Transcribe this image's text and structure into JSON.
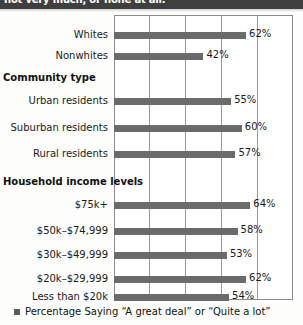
{
  "banner": {
    "text": "not very much, or none at all."
  },
  "legend": {
    "marker": "square-marker",
    "text": "Percentage Saying “A great deal” or “Quite a lot”"
  },
  "chart_data": {
    "type": "bar",
    "orientation": "horizontal",
    "title": "",
    "xlabel": "",
    "ylabel": "",
    "xlim": [
      0,
      84
    ],
    "grid": true,
    "grid_axis": "x",
    "gridline_count": 6,
    "legend_position": "bottom-left",
    "bar_color": "#6b6b6b",
    "value_suffix": "%",
    "sections": [
      {
        "header": "",
        "categories": [
          "Whites",
          "Nonwhites"
        ],
        "values": [
          62,
          42
        ],
        "labels": [
          "62%",
          "42%"
        ]
      },
      {
        "header": "Community type",
        "categories": [
          "Urban residents",
          "Suburban residents",
          "Rural residents"
        ],
        "values": [
          55,
          60,
          57
        ],
        "labels": [
          "55%",
          "60%",
          "57%"
        ]
      },
      {
        "header": "Household income levels",
        "categories": [
          "$75k+",
          "$50k–$74,999",
          "$30k–$49,999",
          "$20k–$29,999",
          "Less than $20k"
        ],
        "values": [
          64,
          58,
          53,
          62,
          54
        ],
        "labels": [
          "64%",
          "58%",
          "53%",
          "62%",
          "54%"
        ]
      }
    ],
    "all_categories": [
      "Whites",
      "Nonwhites",
      "Urban residents",
      "Suburban residents",
      "Rural residents",
      "$75k+",
      "$50k–$74,999",
      "$30k–$49,999",
      "$20k–$29,999",
      "Less than $20k"
    ],
    "all_values": [
      62,
      42,
      55,
      60,
      57,
      64,
      58,
      53,
      62,
      54
    ]
  },
  "rows": [
    {
      "label": "Whites",
      "value": 62,
      "value_label": "62%",
      "top": 26
    },
    {
      "label": "Nonwhites",
      "value": 42,
      "value_label": "42%",
      "top": 47
    },
    {
      "label": "Urban residents",
      "value": 55,
      "value_label": "55%",
      "top": 92
    },
    {
      "label": "Suburban residents",
      "value": 60,
      "value_label": "60%",
      "top": 119
    },
    {
      "label": "Rural residents",
      "value": 57,
      "value_label": "57%",
      "top": 145
    },
    {
      "label": "$75k+",
      "value": 64,
      "value_label": "64%",
      "top": 196
    },
    {
      "label": "$50k–$74,999",
      "value": 58,
      "value_label": "58%",
      "top": 222
    },
    {
      "label": "$30k–$49,999",
      "value": 53,
      "value_label": "53%",
      "top": 246
    },
    {
      "label": "$20k–$29,999",
      "value": 62,
      "value_label": "62%",
      "top": 270
    },
    {
      "label": "Less than $20k",
      "value": 54,
      "value_label": "54%",
      "top": 288
    }
  ],
  "section_headers": [
    {
      "text": "Community type",
      "top": 72
    },
    {
      "text": "Household income levels",
      "top": 176
    }
  ]
}
